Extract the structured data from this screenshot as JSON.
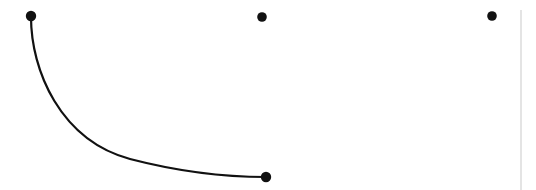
{
  "figure": {
    "title": "",
    "width": 536,
    "height": 190,
    "background_color": "#ffffff",
    "stroke_color": "#111111",
    "rule_color": "#c9c9c9"
  },
  "chart_data": {
    "type": "scatter",
    "title": "",
    "subtitle": "",
    "xlabel": "",
    "ylabel": "",
    "xlim": [
      0,
      536
    ],
    "ylim": [
      190,
      0
    ],
    "grid": false,
    "legend": null,
    "legend_position": "none",
    "axis_visible": false,
    "tick_labels_x": [],
    "tick_labels_y": [],
    "annotations": [],
    "series": [
      {
        "name": "markers",
        "type": "scatter",
        "marker": "circle",
        "marker_color": "#111111",
        "marker_radius": 5,
        "points": [
          {
            "label": "point-1",
            "x": 31,
            "y": 16
          },
          {
            "label": "point-2",
            "x": 262,
            "y": 17
          },
          {
            "label": "point-3",
            "x": 492,
            "y": 16
          },
          {
            "label": "point-4",
            "x": 266,
            "y": 177
          }
        ]
      },
      {
        "name": "curve",
        "type": "line",
        "line_color": "#111111",
        "line_width": 2.2,
        "smooth": true,
        "path": "M 31 17 C 31 70, 60 140, 130 159 C 180 172, 230 177, 266 177",
        "endpoints": [
          {
            "label": "curve-start",
            "x": 31,
            "y": 17
          },
          {
            "label": "curve-end",
            "x": 266,
            "y": 177
          }
        ],
        "sampled_points": [
          {
            "x": 31,
            "y": 17
          },
          {
            "x": 38,
            "y": 50
          },
          {
            "x": 45,
            "y": 85
          },
          {
            "x": 60,
            "y": 110
          },
          {
            "x": 90,
            "y": 130
          },
          {
            "x": 130,
            "y": 159
          },
          {
            "x": 170,
            "y": 167
          },
          {
            "x": 210,
            "y": 172
          },
          {
            "x": 266,
            "y": 177
          }
        ]
      }
    ],
    "rules": [
      {
        "label": "vertical-rule",
        "orientation": "vertical",
        "x": 521,
        "y_start": 10,
        "y_end": 190,
        "color": "#c9c9c9",
        "width": 1
      }
    ]
  }
}
